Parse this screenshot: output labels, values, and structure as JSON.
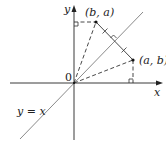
{
  "diagram": {
    "axes": {
      "x_label": "x",
      "y_label": "y",
      "origin_label": "0"
    },
    "line_label": "y = x",
    "points": [
      {
        "id": "P",
        "label": "(a, b)"
      },
      {
        "id": "Q",
        "label": "(b, a)"
      }
    ],
    "annotations": {
      "right_angle_marks": 3,
      "equal_segment_ticks": 2
    },
    "colors": {
      "axis": "#3a3a3a",
      "diagonal": "#8a8a8a",
      "dashed": "#333333",
      "text": "#222222"
    }
  }
}
